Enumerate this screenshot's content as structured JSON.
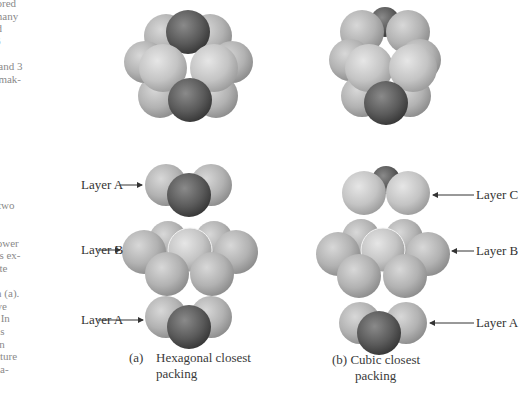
{
  "left_text_top": [
    "plored",
    "l many",
    "uld",
    "s 6",
    "3",
    "y, and 3",
    "e, mak-",
    "ch",
    "s."
  ],
  "left_text_bottom": [
    "of two",
    "in",
    "as",
    "e lower",
    "ares ex-",
    "Note",
    "ers",
    "s in (a).",
    "have",
    "b). In",
    "re is",
    "n an",
    "ructure",
    "dina-"
  ],
  "figure": {
    "left": {
      "labels": {
        "top": "Layer A",
        "middle": "Layer B",
        "bottom": "Layer A"
      },
      "caption_marker": "(a)",
      "caption_line1": "Hexagonal closest",
      "caption_line2": "packing"
    },
    "right": {
      "labels": {
        "top": "Layer C",
        "middle": "Layer B",
        "bottom": "Layer A"
      },
      "caption_line1": "(b) Cubic closest",
      "caption_line2": "packing"
    }
  },
  "colors": {
    "light_sphere": "#c8c8c8",
    "dark_sphere": "#5a5a5a",
    "text": "#333333"
  }
}
